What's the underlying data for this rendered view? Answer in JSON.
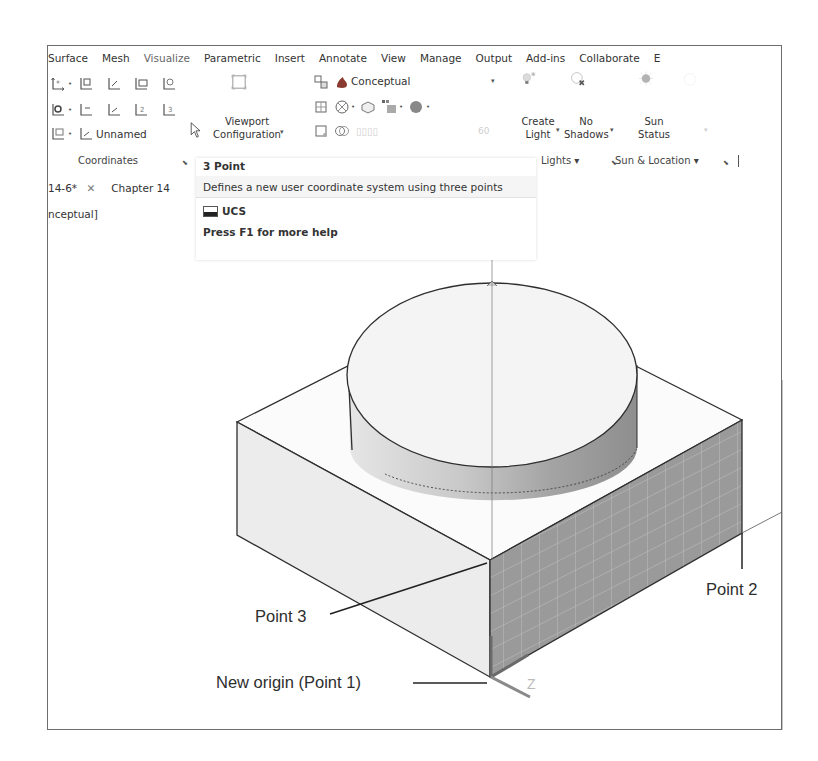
{
  "ribbon": {
    "tabs": [
      {
        "label": "Surface"
      },
      {
        "label": "Mesh"
      },
      {
        "label": "Visualize"
      },
      {
        "label": "Parametric"
      },
      {
        "label": "Insert"
      },
      {
        "label": "Annotate"
      },
      {
        "label": "View"
      },
      {
        "label": "Manage"
      },
      {
        "label": "Output"
      },
      {
        "label": "Add-ins"
      },
      {
        "label": "Collaborate"
      },
      {
        "label": "E"
      }
    ],
    "active_tab": "Visualize",
    "coordinates_panel": {
      "label": "Coordinates",
      "named_ucs_label": "Unnamed",
      "icons": [
        "ucs-icon",
        "ucs-world-icon",
        "ucs-previous-icon",
        "ucs-face-icon",
        "ucs-object-icon",
        "ucs-view-icon",
        "ucs-origin-icon",
        "ucs-zaxis-icon",
        "ucs-3point-icon",
        "ucs-named-icon",
        "ucs-named-combo-icon"
      ]
    },
    "model_viewports_panel": {
      "viewport_configuration_label_line1": "Viewport",
      "viewport_configuration_label_line2": "Configuration"
    },
    "visual_styles_panel": {
      "current_style": "Conceptual"
    },
    "lights_panel": {
      "label": "Lights",
      "create_light_line1": "Create",
      "create_light_line2": "Light",
      "no_shadows_line1": "No",
      "no_shadows_line2": "Shadows"
    },
    "sun_location_panel": {
      "label": "Sun & Location",
      "sun_status_line1": "Sun",
      "sun_status_line2": "Status"
    }
  },
  "document_tabs": [
    {
      "label": "14-6*",
      "closable": true
    },
    {
      "label": "Chapter 14",
      "closable": false
    }
  ],
  "viewport_label": "nceptual]",
  "tooltip": {
    "title": "3 Point",
    "description": "Defines a new user coordinate system using three points",
    "command": "UCS",
    "help": "Press F1 for more help"
  },
  "callouts": {
    "point2": "Point 2",
    "point3": "Point 3",
    "origin": "New origin (Point 1)",
    "z_axis": "Z"
  },
  "colors": {
    "frame_border": "#6d6d6d",
    "shaded_face": "#9a9a9a",
    "light_face": "#ededed",
    "line": "#2e2e2e"
  }
}
